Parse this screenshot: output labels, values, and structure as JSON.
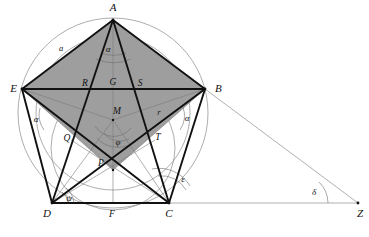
{
  "figure": {
    "background_color": "#ffffff",
    "shaded_fill": "#9e9e9e",
    "stroke_dark": "#111111",
    "stroke_light": "#777777",
    "stroke_hairline": "#8a8a8a"
  },
  "vertices": [
    {
      "id": "A",
      "label": "A",
      "x": 113,
      "y": 20,
      "label_x": 113,
      "label_y": 11
    },
    {
      "id": "B",
      "label": "B",
      "x": 205,
      "y": 89,
      "label_x": 215,
      "label_y": 91
    },
    {
      "id": "C",
      "label": "C",
      "x": 169,
      "y": 203,
      "label_x": 169,
      "label_y": 216
    },
    {
      "id": "D",
      "label": "D",
      "x": 52,
      "y": 203,
      "label_x": 47,
      "label_y": 216
    },
    {
      "id": "E",
      "label": "E",
      "x": 22,
      "y": 89,
      "label_x": 11,
      "label_y": 91
    },
    {
      "id": "Z",
      "label": "Z",
      "x": 358,
      "y": 203,
      "label_x": 360,
      "label_y": 216
    }
  ],
  "interior_points": [
    {
      "id": "R",
      "label": "R",
      "x": 87,
      "y": 89,
      "label_x": 85,
      "label_y": 86
    },
    {
      "id": "G",
      "label": "G",
      "x": 113,
      "y": 89,
      "label_x": 113,
      "label_y": 85
    },
    {
      "id": "S",
      "label": "S",
      "x": 139,
      "y": 89,
      "label_x": 139,
      "label_y": 86
    },
    {
      "id": "M",
      "label": "M",
      "x": 113,
      "y": 120,
      "label_x": 116,
      "label_y": 114
    },
    {
      "id": "Q",
      "label": "Q",
      "x": 71,
      "y": 140,
      "label_x": 67,
      "label_y": 140
    },
    {
      "id": "T",
      "label": "T",
      "x": 155,
      "y": 140,
      "label_x": 157,
      "label_y": 139
    },
    {
      "id": "P",
      "label": "P",
      "x": 113,
      "y": 170,
      "label_x": 100,
      "label_y": 165
    },
    {
      "id": "F",
      "label": "F",
      "x": 113,
      "y": 203,
      "label_x": 112,
      "label_y": 216
    }
  ],
  "angle_labels": [
    {
      "id": "alpha-apex",
      "label": "α",
      "x": 108,
      "y": 50
    },
    {
      "id": "alpha-left",
      "label": "α",
      "x": 36,
      "y": 120
    },
    {
      "id": "alpha-right",
      "label": "α",
      "x": 186,
      "y": 119
    },
    {
      "id": "phi",
      "label": "φ",
      "x": 118,
      "y": 143
    },
    {
      "id": "psi",
      "label": "ψ",
      "x": 69,
      "y": 200
    },
    {
      "id": "epsilon",
      "label": "ε",
      "x": 183,
      "y": 181
    },
    {
      "id": "delta",
      "label": "δ",
      "x": 314,
      "y": 193
    }
  ],
  "length_labels": [
    {
      "id": "side-a",
      "label": "a",
      "x": 61,
      "y": 50
    },
    {
      "id": "radius-r",
      "label": "r",
      "x": 159,
      "y": 114
    }
  ],
  "circles": [
    {
      "id": "circumcircle",
      "cx": 113,
      "cy": 113,
      "r": 95,
      "stroke": "#8a8a8a"
    },
    {
      "id": "incircle",
      "cx": 113,
      "cy": 113,
      "r": 77,
      "stroke": "#8a8a8a"
    },
    {
      "id": "lower-circle",
      "cx": 113,
      "cy": 148,
      "r": 62,
      "stroke": "#8a8a8a"
    }
  ],
  "shaded_polygon": {
    "id": "kite-AEPB",
    "points": "113,20 22,89 113,170 205,89",
    "fill": "#9e9e9e"
  },
  "heavy_segments": [
    {
      "id": "AE",
      "from": "A",
      "to": "E"
    },
    {
      "id": "AB",
      "from": "A",
      "to": "B"
    },
    {
      "id": "EB",
      "from": "E",
      "to": "B"
    },
    {
      "id": "ED",
      "from": "E",
      "to": "D"
    },
    {
      "id": "BC",
      "from": "B",
      "to": "C"
    },
    {
      "id": "DC",
      "from": "D",
      "to": "C"
    },
    {
      "id": "AC",
      "from": "A",
      "to": "C"
    },
    {
      "id": "AD",
      "from": "A",
      "to": "D"
    },
    {
      "id": "EC",
      "from": "E",
      "to": "C"
    },
    {
      "id": "DB",
      "from": "D",
      "to": "B"
    }
  ],
  "light_segments": [
    {
      "id": "EM",
      "from": "E",
      "to": "M"
    },
    {
      "id": "BM",
      "from": "B",
      "to": "M"
    },
    {
      "id": "DM",
      "from": "D",
      "to": "M"
    },
    {
      "id": "CM",
      "from": "C",
      "to": "M"
    },
    {
      "id": "AM-axis",
      "from": "A",
      "to": "F"
    },
    {
      "id": "EP",
      "from": "E",
      "to": "P"
    },
    {
      "id": "BP",
      "from": "B",
      "to": "P"
    },
    {
      "id": "BZ",
      "from": "B",
      "to": "Z"
    },
    {
      "id": "DZ",
      "from": "D",
      "to": "Z"
    },
    {
      "id": "EC2",
      "from": "E",
      "to": "C"
    },
    {
      "id": "DT",
      "from": "D",
      "to": "T"
    },
    {
      "id": "CQ",
      "from": "C",
      "to": "Q"
    }
  ]
}
